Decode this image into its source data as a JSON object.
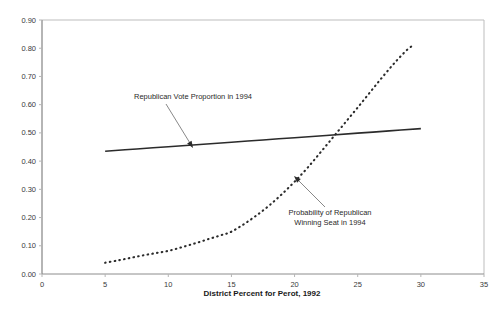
{
  "chart_data": {
    "type": "line",
    "title": "",
    "xlabel": "District Percent for Perot, 1992",
    "ylabel": "",
    "xlim": [
      0,
      35
    ],
    "ylim": [
      0.0,
      0.9
    ],
    "xticks": [
      "0",
      "5",
      "10",
      "15",
      "20",
      "25",
      "30",
      "35"
    ],
    "xtick_values": [
      0,
      5,
      10,
      15,
      20,
      25,
      30,
      35
    ],
    "yticks": [
      "0.00",
      "0.10",
      "0.20",
      "0.30",
      "0.40",
      "0.50",
      "0.60",
      "0.70",
      "0.80",
      "0.90"
    ],
    "ytick_values": [
      0.0,
      0.1,
      0.2,
      0.3,
      0.4,
      0.5,
      0.6,
      0.7,
      0.8,
      0.9
    ],
    "grid": false,
    "legend": "none (inline annotations)",
    "series": [
      {
        "name": "Republican Vote Proportion in 1994",
        "style": "solid",
        "color": "#2b2b2b",
        "x": [
          5,
          7.5,
          10,
          12.5,
          15,
          17.5,
          20,
          22.5,
          25,
          27.5,
          30
        ],
        "values": [
          0.435,
          0.443,
          0.451,
          0.459,
          0.467,
          0.475,
          0.483,
          0.491,
          0.499,
          0.507,
          0.515
        ]
      },
      {
        "name": "Probability of Republican Winning Seat in 1994",
        "style": "dotted",
        "color": "#2b2b2b",
        "x": [
          5,
          6,
          7,
          8,
          9,
          10,
          11,
          12,
          13,
          14,
          15,
          16,
          17,
          18,
          19,
          20,
          21,
          22,
          23,
          24,
          25,
          26,
          27,
          28,
          29,
          29.5
        ],
        "values": [
          0.04,
          0.048,
          0.057,
          0.066,
          0.074,
          0.082,
          0.094,
          0.107,
          0.121,
          0.135,
          0.15,
          0.177,
          0.208,
          0.243,
          0.283,
          0.327,
          0.375,
          0.428,
          0.482,
          0.536,
          0.59,
          0.645,
          0.7,
          0.752,
          0.798,
          0.812
        ]
      }
    ],
    "annotations": [
      {
        "text_line1": "Republican Vote Proportion in 1994",
        "text_line2": "",
        "text_x": 193,
        "text_y": 99,
        "leader_from_x": 166,
        "leader_from_y": 104,
        "leader_to_x": 193,
        "leader_to_y": 148,
        "arrow_dir": "down-right"
      },
      {
        "text_line1": "Probability of Republican",
        "text_line2": "Winning Seat in 1994",
        "text_x": 330,
        "text_y": 215,
        "leader_from_x": 325,
        "leader_from_y": 207,
        "leader_to_x": 294,
        "leader_to_y": 176,
        "arrow_dir": "up-left"
      }
    ]
  },
  "axis": {
    "x_title": "District Percent for Perot, 1992"
  },
  "colors": {
    "series": "#2b2b2b",
    "frame": "#bdbdbd",
    "axis": "#8c8c8c",
    "tick_text": "#3a3a3a",
    "annotation_text": "#2a2a2a",
    "background": "#ffffff"
  }
}
